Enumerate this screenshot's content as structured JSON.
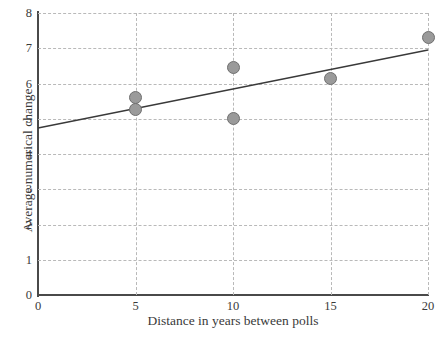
{
  "chart_data": {
    "type": "scatter",
    "title": "",
    "xlabel": "Distance in years between polls",
    "ylabel": "Average numerical change",
    "xlim": [
      0,
      20
    ],
    "ylim": [
      0,
      8
    ],
    "xticks": [
      0,
      5,
      10,
      15,
      20
    ],
    "yticks": [
      0,
      1,
      2,
      3,
      4,
      5,
      6,
      7,
      8
    ],
    "xtick_labels": [
      "0",
      "5",
      "10",
      "15",
      "20"
    ],
    "ytick_labels": [
      "0",
      "1",
      "2",
      "3",
      "4",
      "5",
      "6",
      "7",
      "8"
    ],
    "grid": true,
    "grid_style": "dashed",
    "grid_color": "#b9b9b9",
    "legend": false,
    "marker_color": "#9a9a9a",
    "marker_edge_color": "#6f6f6f",
    "line_color": "#3a3a3a",
    "points": [
      {
        "x": 5,
        "y": 5.6
      },
      {
        "x": 5,
        "y": 5.25
      },
      {
        "x": 10,
        "y": 6.45
      },
      {
        "x": 10,
        "y": 5.0
      },
      {
        "x": 15,
        "y": 6.15
      },
      {
        "x": 20,
        "y": 7.3
      }
    ],
    "series": [
      {
        "name": "Observations",
        "type": "scatter",
        "x": [
          5,
          5,
          10,
          10,
          15,
          20
        ],
        "values": [
          5.6,
          5.25,
          6.45,
          5.0,
          6.15,
          7.3
        ]
      },
      {
        "name": "Trend line",
        "type": "line",
        "x": [
          0,
          20
        ],
        "values": [
          4.74,
          6.95
        ]
      }
    ],
    "trend_line": {
      "x0": 0,
      "y0": 4.74,
      "x1": 20,
      "y1": 6.95
    }
  }
}
